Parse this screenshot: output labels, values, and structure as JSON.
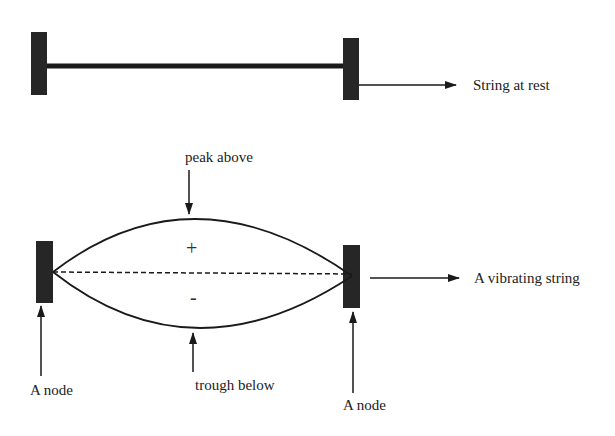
{
  "diagram": {
    "colors": {
      "ink": "#1a1a1a",
      "post": "#262626",
      "background": "#ffffff"
    },
    "rest": {
      "label": "String at rest"
    },
    "vibrating": {
      "label": "A vibrating string",
      "peak_label": "peak above",
      "trough_label": "trough below",
      "plus_sign": "+",
      "minus_sign": "-",
      "left_node_label": "A node",
      "right_node_label": "A node"
    }
  }
}
